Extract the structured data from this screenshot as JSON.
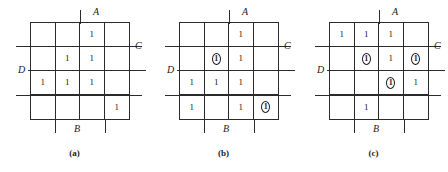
{
  "figure": {
    "type": "karnaugh-map-set",
    "panel_count": 3,
    "grid_rows": 4,
    "grid_cols": 4,
    "ink_color": "#1a1a1a",
    "line_color": "#2b2b2b",
    "background": "#ffffff"
  },
  "variables": {
    "a": "A",
    "b": "B",
    "c": "C",
    "d": "D"
  },
  "panels": [
    {
      "caption": "(a)",
      "labels": {
        "a": "A",
        "b": "B",
        "c": "C",
        "d": "D"
      },
      "cells": [
        [
          {
            "value": "",
            "circled": false
          },
          {
            "value": "",
            "circled": false
          },
          {
            "value": "1",
            "circled": false
          },
          {
            "value": "",
            "circled": false
          }
        ],
        [
          {
            "value": "",
            "circled": false
          },
          {
            "value": "1",
            "circled": false
          },
          {
            "value": "1",
            "circled": false
          },
          {
            "value": "",
            "circled": false
          }
        ],
        [
          {
            "value": "1",
            "circled": false
          },
          {
            "value": "1",
            "circled": false
          },
          {
            "value": "1",
            "circled": false
          },
          {
            "value": "",
            "circled": false
          }
        ],
        [
          {
            "value": "",
            "circled": false
          },
          {
            "value": "",
            "circled": false
          },
          {
            "value": "",
            "circled": false
          },
          {
            "value": "1",
            "circled": false
          }
        ]
      ]
    },
    {
      "caption": "(b)",
      "labels": {
        "a": "A",
        "b": "B",
        "c": "C",
        "d": "D"
      },
      "cells": [
        [
          {
            "value": "",
            "circled": false
          },
          {
            "value": "",
            "circled": false
          },
          {
            "value": "1",
            "circled": false
          },
          {
            "value": "",
            "circled": false
          }
        ],
        [
          {
            "value": "",
            "circled": false
          },
          {
            "value": "1",
            "circled": true
          },
          {
            "value": "1",
            "circled": false
          },
          {
            "value": "",
            "circled": false
          }
        ],
        [
          {
            "value": "1",
            "circled": false
          },
          {
            "value": "1",
            "circled": false
          },
          {
            "value": "1",
            "circled": false
          },
          {
            "value": "",
            "circled": false
          }
        ],
        [
          {
            "value": "1",
            "circled": false
          },
          {
            "value": "",
            "circled": false
          },
          {
            "value": "1",
            "circled": false
          },
          {
            "value": "1",
            "circled": true
          }
        ]
      ]
    },
    {
      "caption": "(c)",
      "labels": {
        "a": "A",
        "b": "B",
        "c": "C",
        "d": "D"
      },
      "cells": [
        [
          {
            "value": "1",
            "circled": false
          },
          {
            "value": "1",
            "circled": false
          },
          {
            "value": "1",
            "circled": false
          },
          {
            "value": "",
            "circled": false
          }
        ],
        [
          {
            "value": "",
            "circled": false
          },
          {
            "value": "1",
            "circled": true
          },
          {
            "value": "1",
            "circled": false
          },
          {
            "value": "1",
            "circled": true
          }
        ],
        [
          {
            "value": "",
            "circled": false
          },
          {
            "value": "",
            "circled": false
          },
          {
            "value": "1",
            "circled": true
          },
          {
            "value": "1",
            "circled": false
          }
        ],
        [
          {
            "value": "",
            "circled": false
          },
          {
            "value": "1",
            "circled": false
          },
          {
            "value": "",
            "circled": false
          },
          {
            "value": "",
            "circled": false
          }
        ]
      ]
    }
  ]
}
